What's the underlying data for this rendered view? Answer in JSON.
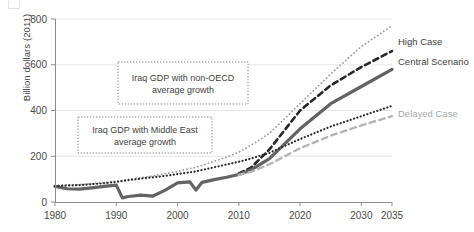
{
  "chart_data": {
    "type": "line",
    "title": "",
    "xlabel": "",
    "ylabel": "Billion dollars (2011)",
    "xlim": [
      1980,
      2035
    ],
    "ylim": [
      0,
      800
    ],
    "xticks": [
      1980,
      1990,
      2000,
      2010,
      2020,
      2030,
      2035
    ],
    "yticks": [
      0,
      200,
      400,
      600,
      800
    ],
    "grid": "horizontal",
    "legend_position": "right-inline",
    "x": [
      1980,
      1982,
      1984,
      1986,
      1988,
      1990,
      1991,
      1992,
      1994,
      1996,
      1998,
      2000,
      2002,
      2003,
      2004,
      2006,
      2008,
      2010,
      2012,
      2015,
      2020,
      2025,
      2030,
      2035
    ],
    "series": [
      {
        "name": "Iraq GDP with non-OECD average growth",
        "style": "dotted",
        "color": "#9a9a9a",
        "width": 1.8,
        "values": [
          72,
          74,
          76,
          80,
          84,
          90,
          94,
          99,
          106,
          114,
          124,
          134,
          146,
          152,
          160,
          178,
          196,
          218,
          248,
          300,
          430,
          560,
          680,
          770
        ]
      },
      {
        "name": "High Case",
        "style": "dashed",
        "color": "#262626",
        "width": 2.6,
        "values": [
          null,
          null,
          null,
          null,
          null,
          null,
          null,
          null,
          null,
          null,
          null,
          null,
          null,
          null,
          null,
          null,
          null,
          125,
          150,
          230,
          400,
          510,
          590,
          660
        ]
      },
      {
        "name": "Central Scenario",
        "style": "solid",
        "color": "#636363",
        "width": 3.2,
        "values": [
          68,
          58,
          56,
          62,
          68,
          74,
          18,
          24,
          30,
          26,
          52,
          84,
          88,
          52,
          86,
          98,
          108,
          120,
          140,
          190,
          320,
          430,
          505,
          580
        ]
      },
      {
        "name": "Iraq GDP with Middle East average growth",
        "style": "dotted-dense",
        "color": "#2b2b2b",
        "width": 2.2,
        "values": [
          70,
          72,
          74,
          78,
          82,
          88,
          92,
          96,
          102,
          108,
          114,
          122,
          130,
          134,
          140,
          152,
          164,
          176,
          190,
          215,
          275,
          330,
          375,
          420
        ]
      },
      {
        "name": "Delayed Case",
        "style": "dashed-light",
        "color": "#b5b5b5",
        "width": 2.4,
        "values": [
          null,
          null,
          null,
          null,
          null,
          null,
          null,
          null,
          null,
          null,
          null,
          null,
          null,
          null,
          null,
          null,
          null,
          118,
          132,
          165,
          235,
          290,
          335,
          375
        ]
      }
    ],
    "annotations": [
      {
        "id": "non-oecd",
        "lines": [
          "Iraq GDP with non-OECD",
          "average growth"
        ],
        "box": {
          "x": 118,
          "y": 62,
          "w": 130,
          "h": 42
        }
      },
      {
        "id": "middle-east",
        "lines": [
          "Iraq GDP with Middle East",
          "average growth"
        ],
        "box": {
          "x": 78,
          "y": 117,
          "w": 134,
          "h": 36
        }
      }
    ],
    "inline_labels": [
      {
        "id": "high-case",
        "text": "High Case",
        "x": 398,
        "y": 45,
        "muted": false
      },
      {
        "id": "central-scenario",
        "text": "Central Scenario",
        "x": 398,
        "y": 65,
        "muted": false
      },
      {
        "id": "delayed-case",
        "text": "Delayed Case",
        "x": 398,
        "y": 117,
        "muted": true
      }
    ]
  },
  "axis": {
    "y_label": "Billion dollars (2011)",
    "y_ticks": [
      "800",
      "600",
      "400",
      "200",
      "0"
    ],
    "x_ticks": [
      "1980",
      "1990",
      "2000",
      "2010",
      "2020",
      "2030",
      "2035"
    ]
  },
  "annotations": {
    "non_oecd_line1": "Iraq GDP with non-OECD",
    "non_oecd_line2": "average growth",
    "middle_east_line1": "Iraq GDP with Middle East",
    "middle_east_line2": "average growth"
  },
  "legend": {
    "high_case": "High Case",
    "central_scenario": "Central Scenario",
    "delayed_case": "Delayed Case"
  },
  "colors": {
    "central": "#636363",
    "high": "#262626",
    "delayed": "#b5b5b5",
    "non_oecd": "#9a9a9a",
    "middle_east": "#2b2b2b",
    "grid": "#e6e6e6",
    "axis": "#8d8d8d"
  }
}
